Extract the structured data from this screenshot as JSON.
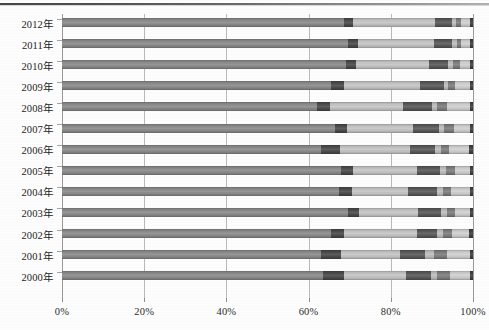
{
  "chart_data": {
    "type": "bar",
    "orientation": "horizontal",
    "stacked": true,
    "normalized": true,
    "title": "",
    "xlabel": "",
    "ylabel": "",
    "xlim": [
      0,
      100
    ],
    "grid": true,
    "legend_position": "none",
    "x_tick_labels": [
      "0%",
      "20%",
      "40%",
      "60%",
      "80%",
      "100%"
    ],
    "x_tick_values": [
      0,
      20,
      40,
      60,
      80,
      100
    ],
    "categories": [
      "2012年",
      "2011年",
      "2010年",
      "2009年",
      "2008年",
      "2007年",
      "2006年",
      "2005年",
      "2004年",
      "2003年",
      "2002年",
      "2001年",
      "2000年"
    ],
    "series": [
      {
        "name": "series-1",
        "color": "#8a8a8a",
        "values": [
          68.5,
          69.5,
          69.0,
          65.5,
          62.0,
          66.5,
          63.0,
          68.0,
          67.5,
          69.5,
          65.5,
          63.0,
          63.5
        ]
      },
      {
        "name": "series-2",
        "color": "#4a4a4a",
        "values": [
          2.2,
          2.6,
          2.6,
          3.0,
          3.2,
          2.8,
          4.6,
          2.8,
          3.0,
          2.8,
          3.0,
          5.0,
          5.2
        ]
      },
      {
        "name": "series-3",
        "color": "#c4c4c4",
        "values": [
          20.0,
          18.5,
          17.6,
          18.5,
          17.8,
          16.0,
          17.0,
          15.6,
          13.6,
          14.4,
          17.8,
          14.2,
          15.0
        ]
      },
      {
        "name": "series-4",
        "color": "#595959",
        "values": [
          4.2,
          4.4,
          4.8,
          6.0,
          7.0,
          6.4,
          6.2,
          5.6,
          7.2,
          5.4,
          5.0,
          6.2,
          6.0
        ]
      },
      {
        "name": "series-5",
        "color": "#bdbdbd",
        "values": [
          0.9,
          1.0,
          1.2,
          1.0,
          1.2,
          1.2,
          1.4,
          1.4,
          1.4,
          1.6,
          1.4,
          2.0,
          1.6
        ]
      },
      {
        "name": "series-6",
        "color": "#7d7d7d",
        "values": [
          1.4,
          1.2,
          1.6,
          1.6,
          2.4,
          2.4,
          2.0,
          2.2,
          2.0,
          2.0,
          2.2,
          3.4,
          3.0
        ]
      },
      {
        "name": "series-7",
        "color": "#cfcfcf",
        "values": [
          2.0,
          2.0,
          2.4,
          3.6,
          5.6,
          3.9,
          4.8,
          3.6,
          4.5,
          3.5,
          4.2,
          5.4,
          4.9
        ]
      },
      {
        "name": "series-8",
        "color": "#3f3f3f",
        "values": [
          0.8,
          0.8,
          0.8,
          0.8,
          0.8,
          0.8,
          1.0,
          0.8,
          0.8,
          0.8,
          0.9,
          0.8,
          0.8
        ]
      }
    ]
  },
  "figure": {
    "background_color": "#fdfdfd",
    "gridline_color": "#b9b9b9",
    "axis_color": "#9a9a9a",
    "text_color": "#242424"
  }
}
